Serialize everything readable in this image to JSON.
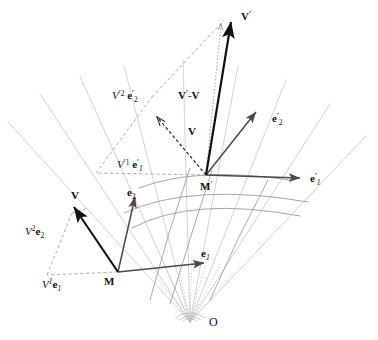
{
  "figure": {
    "origin_label": "O",
    "colors": {
      "vector_black": "#111111",
      "basis_dark_gray": "#555555",
      "grid_light_gray": "#c9c9c9",
      "grid_mid_gray": "#9a9a9a",
      "dashed_gray": "#9a9a9a",
      "background": "#ffffff"
    }
  },
  "labels": {
    "origin": {
      "text": "O"
    },
    "point_m": {
      "text": "M"
    },
    "point_m_prime": {
      "text": "M",
      "prime": "′"
    },
    "vector_v_lower": {
      "text": "V"
    },
    "vector_v_transported": {
      "text": "V"
    },
    "vector_v_prime": {
      "text": "V",
      "prime": "′"
    },
    "vector_difference": {
      "text": "V′-V"
    },
    "basis_e1": {
      "text": "e",
      "sub": "1"
    },
    "basis_e2": {
      "text": "e",
      "sub": "2"
    },
    "basis_e1_prime": {
      "text": "e",
      "prime": "′",
      "sub": "1"
    },
    "basis_e2_prime": {
      "text": "e",
      "prime": "′",
      "sub": "2"
    },
    "component_v1e1": {
      "scalar": "V",
      "sup": "1",
      "basis": "e",
      "sub": "1"
    },
    "component_v2e2": {
      "scalar": "V",
      "sup": "2",
      "basis": "e",
      "sub": "2"
    },
    "component_v1e1_prime": {
      "scalar": "V",
      "prime": "′",
      "sup": "1",
      "basis": "e",
      "basis_prime": "′",
      "sub": "1"
    },
    "component_v2e2_prime": {
      "scalar": "V",
      "prime": "′",
      "sup": "2",
      "basis": "e",
      "basis_prime": "′",
      "sub": "2"
    }
  },
  "text": {
    "O": "O",
    "M": "M",
    "M_prime": "M′",
    "V": "V",
    "V_prime": "V′",
    "V_diff": "V′-V",
    "e1": "e₁",
    "e2": "e₂",
    "e1_prime": "e′₁",
    "e2_prime": "e′₂",
    "V1e1": "V¹e₁",
    "V2e2": "V²e₂",
    "V1e1_prime": "V′¹e′₁",
    "V2e2_prime": "V′²e′₂"
  }
}
